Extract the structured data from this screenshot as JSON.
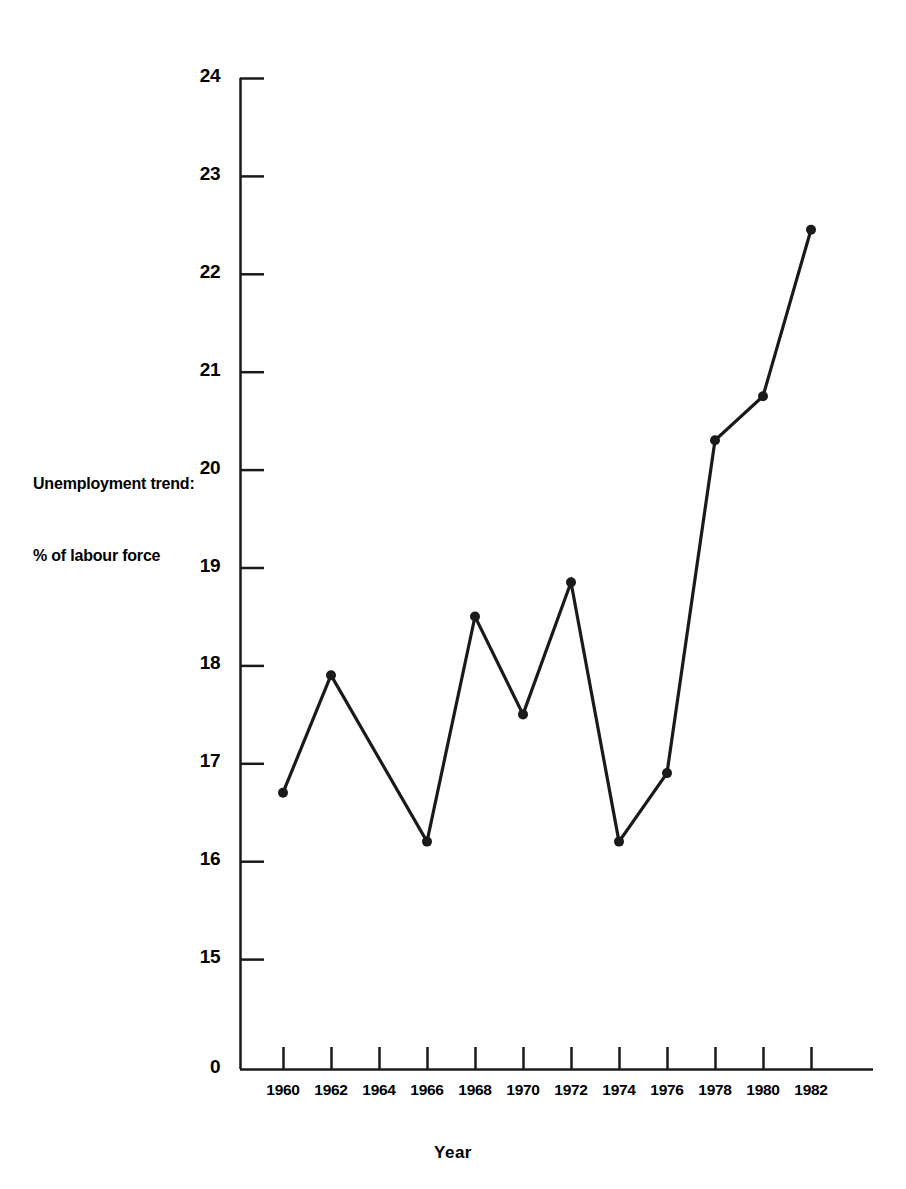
{
  "chart_data": {
    "type": "line",
    "title": "",
    "xlabel": "Year",
    "ylabel": "Unemployment trend:\n% of labour force",
    "ylabel_line1": "Unemployment trend:",
    "ylabel_line2": "% of labour force",
    "x": [
      1960,
      1962,
      1964,
      1966,
      1968,
      1970,
      1972,
      1974,
      1976,
      1978,
      1980,
      1982
    ],
    "categories": [
      "1960",
      "1962",
      "1964",
      "1966",
      "1968",
      "1970",
      "1972",
      "1974",
      "1976",
      "1978",
      "1980",
      "1982"
    ],
    "series": [
      {
        "name": "Unemployment trend: % of labour force",
        "x": [
          1960,
          1962,
          1966,
          1968,
          1970,
          1972,
          1974,
          1976,
          1978,
          1980,
          1982
        ],
        "values": [
          16.7,
          17.9,
          16.2,
          18.5,
          17.5,
          18.85,
          16.2,
          16.9,
          20.3,
          20.75,
          22.45
        ]
      }
    ],
    "ytick_labels": [
      "24",
      "23",
      "22",
      "21",
      "20",
      "19",
      "18",
      "17",
      "16",
      "15",
      "0"
    ],
    "ytick_values": [
      24,
      23,
      22,
      21,
      20,
      19,
      18,
      17,
      16,
      15,
      0
    ],
    "ylim": [
      15,
      24
    ],
    "y_axis_break": true,
    "y_axis_break_note": "axis broken between 0 and 15",
    "xlim": [
      1959,
      1983
    ],
    "grid": false,
    "legend": "none",
    "marker": "filled-circle",
    "line_color": "#1a1a1a",
    "marker_color": "#1a1a1a",
    "background_color": "#ffffff"
  },
  "layout": {
    "plot_left_px": 240,
    "plot_baseline_px": 1069,
    "y_top_value_px": 78,
    "px_per_unit": 97.9,
    "x_first_tick_px": 283,
    "x_tick_spacing_px": 48
  }
}
